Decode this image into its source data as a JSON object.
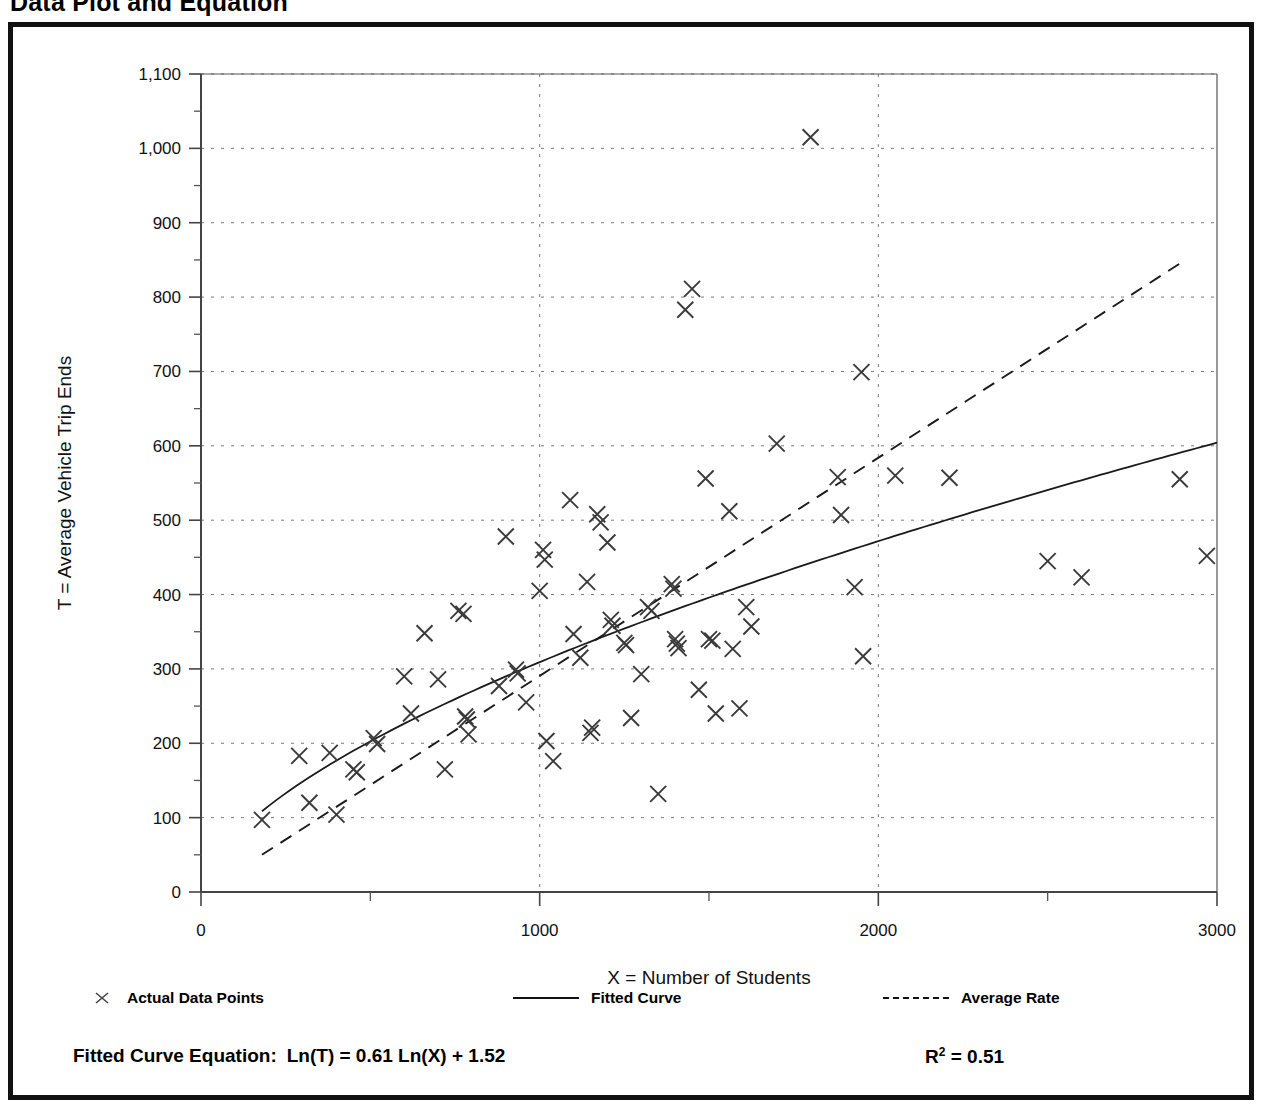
{
  "page_title": "Data Plot and Equation",
  "chart_data": {
    "type": "scatter",
    "title": "Data Plot and Equation",
    "xlabel": "X = Number of Students",
    "ylabel": "T = Average Vehicle Trip Ends",
    "xlim": [
      0,
      3000
    ],
    "ylim": [
      0,
      1100
    ],
    "xticks": [
      0,
      1000,
      2000,
      3000
    ],
    "xtick_labels": [
      "0",
      "1000",
      "2000",
      "3000"
    ],
    "xticks_minor": [
      500,
      1500,
      2500
    ],
    "yticks": [
      0,
      100,
      200,
      300,
      400,
      500,
      600,
      700,
      800,
      900,
      1000,
      1100
    ],
    "ytick_labels": [
      "0",
      "100",
      "200",
      "300",
      "400",
      "500",
      "600",
      "700",
      "800",
      "900",
      "1,000",
      "1,100"
    ],
    "yticks_minor": [
      50,
      150,
      250,
      350,
      450,
      550,
      650,
      750,
      850,
      950,
      1050
    ],
    "grid": "dotted-both",
    "legend_position": "below-axis",
    "marker": "x",
    "series": [
      {
        "name": "Actual Data Points",
        "type": "scatter",
        "points": [
          [
            180,
            97
          ],
          [
            290,
            183
          ],
          [
            320,
            120
          ],
          [
            380,
            187
          ],
          [
            400,
            104
          ],
          [
            450,
            165
          ],
          [
            460,
            161
          ],
          [
            510,
            207
          ],
          [
            520,
            199
          ],
          [
            600,
            290
          ],
          [
            620,
            240
          ],
          [
            660,
            348
          ],
          [
            700,
            286
          ],
          [
            720,
            165
          ],
          [
            760,
            378
          ],
          [
            775,
            374
          ],
          [
            780,
            236
          ],
          [
            785,
            232
          ],
          [
            790,
            212
          ],
          [
            880,
            277
          ],
          [
            900,
            478
          ],
          [
            930,
            299
          ],
          [
            935,
            294
          ],
          [
            960,
            255
          ],
          [
            1000,
            405
          ],
          [
            1010,
            460
          ],
          [
            1015,
            447
          ],
          [
            1020,
            203
          ],
          [
            1040,
            176
          ],
          [
            1090,
            527
          ],
          [
            1100,
            347
          ],
          [
            1120,
            315
          ],
          [
            1140,
            417
          ],
          [
            1150,
            214
          ],
          [
            1155,
            221
          ],
          [
            1170,
            508
          ],
          [
            1180,
            497
          ],
          [
            1200,
            470
          ],
          [
            1210,
            366
          ],
          [
            1215,
            358
          ],
          [
            1250,
            335
          ],
          [
            1255,
            332
          ],
          [
            1270,
            234
          ],
          [
            1300,
            293
          ],
          [
            1320,
            383
          ],
          [
            1330,
            378
          ],
          [
            1350,
            132
          ],
          [
            1390,
            414
          ],
          [
            1395,
            408
          ],
          [
            1400,
            340
          ],
          [
            1405,
            334
          ],
          [
            1410,
            328
          ],
          [
            1430,
            783
          ],
          [
            1450,
            811
          ],
          [
            1470,
            272
          ],
          [
            1490,
            556
          ],
          [
            1500,
            340
          ],
          [
            1510,
            338
          ],
          [
            1520,
            240
          ],
          [
            1560,
            512
          ],
          [
            1570,
            327
          ],
          [
            1590,
            247
          ],
          [
            1610,
            383
          ],
          [
            1625,
            357
          ],
          [
            1700,
            603
          ],
          [
            1800,
            1015
          ],
          [
            1880,
            558
          ],
          [
            1890,
            507
          ],
          [
            1930,
            410
          ],
          [
            1950,
            699
          ],
          [
            1955,
            317
          ],
          [
            2050,
            560
          ],
          [
            2210,
            557
          ],
          [
            2500,
            445
          ],
          [
            2600,
            423
          ],
          [
            2890,
            555
          ],
          [
            2970,
            452
          ]
        ]
      },
      {
        "name": "Fitted Curve",
        "type": "line",
        "style": "solid",
        "equation": "Ln(T) = 0.61 Ln(X) + 1.52",
        "x_range": [
          180,
          3000
        ]
      },
      {
        "name": "Average Rate",
        "type": "line",
        "style": "dashed",
        "x_range": [
          180,
          2900
        ],
        "y_range": [
          50,
          848
        ]
      }
    ]
  },
  "legend": {
    "actual_label": "Actual Data Points",
    "fitted_label": "Fitted Curve",
    "average_label": "Average Rate"
  },
  "equation": {
    "prefix": "Fitted Curve Equation:",
    "formula": "Ln(T) = 0.61 Ln(X) + 1.52",
    "r_squared_symbol": "R",
    "r_squared_exponent": "2",
    "r_squared_value": "= 0.51"
  }
}
